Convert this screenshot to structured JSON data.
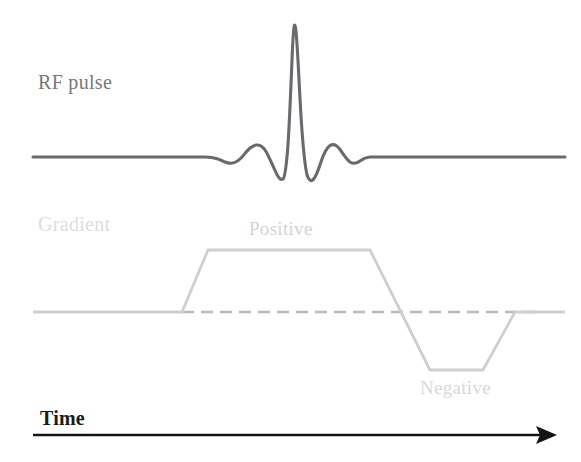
{
  "figure": {
    "width": 581,
    "height": 462,
    "background": "#ffffff"
  },
  "labels": {
    "rf_pulse": "RF pulse",
    "gradient": "Gradient",
    "positive": "Positive",
    "negative": "Negative",
    "time": "Time"
  },
  "colors": {
    "rf_trace": "#6a6a6e",
    "gradient_trace": "#cfcfcf",
    "gradient_dashed": "#b9b9b9",
    "time_axis": "#141414",
    "rf_label": "#77777a",
    "gradient_label": "#dedede",
    "positive_label": "#d3d3d3",
    "negative_label": "#d8d8d8",
    "time_label": "#1b1b1b"
  },
  "chart_data": {
    "type": "line",
    "xlabel": "Time",
    "ylabel": "",
    "grid": false,
    "legend": "none",
    "annotations": [
      {
        "text": "RF pulse",
        "x": 38,
        "y": 82,
        "target": "rf-waveform"
      },
      {
        "text": "Gradient",
        "x": 38,
        "y": 224,
        "target": "gradient-waveform"
      },
      {
        "text": "Positive",
        "x": 249,
        "y": 229,
        "target": "gradient-positive-lobe"
      },
      {
        "text": "Negative",
        "x": 420,
        "y": 388,
        "target": "gradient-negative-lobe"
      },
      {
        "text": "Time",
        "x": 40,
        "y": 418,
        "target": "time-axis"
      }
    ],
    "series": [
      {
        "name": "RF pulse",
        "type": "line",
        "color": "#6a6a6e",
        "description": "Truncated sinc envelope, flat baseline outside the pulse, three main lobes with two negative side-dips",
        "baseline_y": 157,
        "peak_y": 25,
        "x_start": 33,
        "x_end": 565,
        "pulse_x_start": 215,
        "pulse_x_end": 375,
        "points": [
          [
            33,
            157
          ],
          [
            120,
            157
          ],
          [
            200,
            157
          ],
          [
            212,
            157
          ],
          [
            218,
            158
          ],
          [
            224,
            161
          ],
          [
            230,
            163
          ],
          [
            236,
            162
          ],
          [
            242,
            157
          ],
          [
            248,
            150
          ],
          [
            254,
            146
          ],
          [
            259,
            145
          ],
          [
            264,
            148
          ],
          [
            269,
            157
          ],
          [
            274,
            168
          ],
          [
            278,
            176
          ],
          [
            281,
            178
          ],
          [
            284,
            171
          ],
          [
            287,
            140
          ],
          [
            290,
            80
          ],
          [
            293,
            33
          ],
          [
            294,
            25
          ],
          [
            296,
            28
          ],
          [
            299,
            62
          ],
          [
            302,
            118
          ],
          [
            305,
            158
          ],
          [
            308,
            172
          ],
          [
            311,
            178
          ],
          [
            314,
            177
          ],
          [
            317,
            168
          ],
          [
            321,
            156
          ],
          [
            325,
            148
          ],
          [
            330,
            145
          ],
          [
            335,
            147
          ],
          [
            341,
            153
          ],
          [
            347,
            159
          ],
          [
            353,
            163
          ],
          [
            359,
            162
          ],
          [
            365,
            159
          ],
          [
            371,
            157
          ],
          [
            380,
            157
          ],
          [
            470,
            157
          ],
          [
            565,
            157
          ]
        ]
      },
      {
        "name": "Gradient",
        "type": "line",
        "color": "#cfcfcf",
        "description": "Bipolar trapezoidal slice-select gradient: positive lobe followed by negative rephasing lobe",
        "baseline_y": 312,
        "positive_plateau_y": 250,
        "negative_plateau_y": 370,
        "points": [
          [
            33,
            312
          ],
          [
            182,
            312
          ],
          [
            208,
            250
          ],
          [
            370,
            250
          ],
          [
            401,
            312
          ],
          [
            430,
            370
          ],
          [
            483,
            370
          ],
          [
            515,
            312
          ],
          [
            565,
            312
          ]
        ],
        "lobes": [
          {
            "name": "Positive",
            "polarity": "positive",
            "ramp_up_x": [
              182,
              208
            ],
            "plateau_x": [
              208,
              370
            ],
            "ramp_down_x": [
              370,
              401
            ],
            "amplitude_y": 250
          },
          {
            "name": "Negative",
            "polarity": "negative",
            "ramp_down_x": [
              401,
              430
            ],
            "plateau_x": [
              430,
              483
            ],
            "ramp_up_x": [
              483,
              515
            ],
            "amplitude_y": 370
          }
        ]
      },
      {
        "name": "Gradient zero line",
        "type": "dashed",
        "color": "#b9b9b9",
        "description": "Dashed zero reference under the gradient lobes",
        "y": 312,
        "x_start": 182,
        "x_end": 540,
        "dash": [
          12,
          7
        ]
      },
      {
        "name": "Time axis",
        "type": "arrow",
        "color": "#141414",
        "y": 435,
        "x_start": 33,
        "x_end": 557,
        "arrowhead": "right"
      }
    ]
  }
}
